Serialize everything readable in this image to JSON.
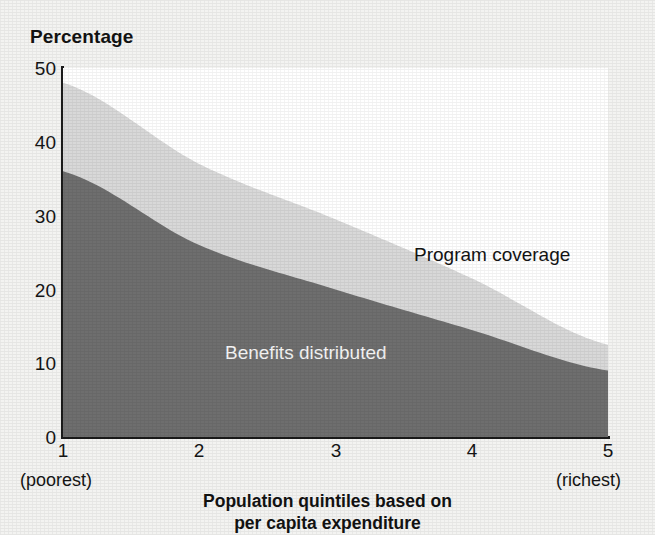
{
  "chart_data": {
    "type": "area",
    "title": "",
    "subtitle": "",
    "ylabel": "Percentage",
    "xlabel": "Population quintiles based on per capita expenditure",
    "xlabel_line1": "Population quintiles based on",
    "xlabel_line2": "per capita expenditure",
    "categories": [
      "1",
      "2",
      "3",
      "4",
      "5"
    ],
    "x": [
      1,
      2,
      3,
      4,
      5
    ],
    "xlim": [
      1,
      5
    ],
    "ylim": [
      0,
      50
    ],
    "y_ticks": [
      "0",
      "10",
      "20",
      "30",
      "40",
      "50"
    ],
    "y_tick_values": [
      0,
      10,
      20,
      30,
      40,
      50
    ],
    "x_ticks": [
      "1",
      "2",
      "3",
      "4",
      "5"
    ],
    "x_endpoint_low": "(poorest)",
    "x_endpoint_high": "(richest)",
    "grid": false,
    "legend_position": "inline-annotations",
    "stacked": false,
    "series": [
      {
        "name": "Program coverage",
        "values": [
          48,
          37,
          29.5,
          21.5,
          12.5
        ],
        "color": "#d8d8d8",
        "label_color": "#141414"
      },
      {
        "name": "Benefits distributed",
        "values": [
          36,
          26,
          20,
          14.5,
          9
        ],
        "color": "#6e6e6e",
        "label_color": "#f4f4f4"
      }
    ],
    "annotations": [
      {
        "text": "Program coverage",
        "series": "Program coverage"
      },
      {
        "text": "Benefits distributed",
        "series": "Benefits distributed"
      }
    ]
  },
  "colors": {
    "page_background": "#f3f3f1",
    "plot_background": "#ffffff",
    "axis": "#1b1b1b",
    "text": "#151515",
    "upper_band": "#d8d8d8",
    "lower_band": "#6e6e6e"
  }
}
